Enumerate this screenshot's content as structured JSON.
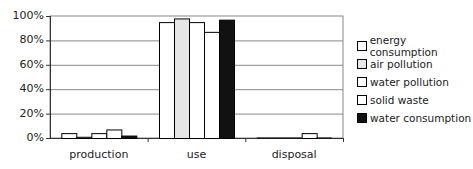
{
  "chart_data": {
    "type": "bar",
    "title": "",
    "xlabel": "",
    "ylabel": "",
    "ylim": [
      0,
      100
    ],
    "yticks": [
      "0%",
      "20%",
      "40%",
      "60%",
      "80%",
      "100%"
    ],
    "grid": true,
    "legend_position": "right",
    "categories": [
      "production",
      "use",
      "disposal"
    ],
    "series": [
      {
        "name": "energy consumption",
        "color": "#ffffff",
        "values": [
          4,
          95,
          0
        ]
      },
      {
        "name": "air pollution",
        "color": "#e6e6e6",
        "values": [
          1,
          98,
          0
        ]
      },
      {
        "name": "water pollution",
        "color": "#ffffff",
        "values": [
          4,
          95,
          0
        ]
      },
      {
        "name": "solid waste",
        "color": "#ffffff",
        "values": [
          7,
          87,
          4
        ]
      },
      {
        "name": "water consumption",
        "color": "#111111",
        "values": [
          2,
          97,
          0
        ]
      }
    ]
  }
}
